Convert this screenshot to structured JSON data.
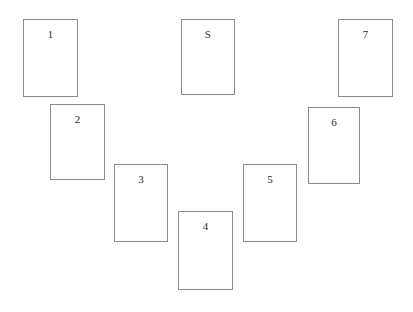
{
  "diagram": {
    "background_color": "#ffffff",
    "border_color": "#8a8a8a",
    "label_color": "#2b2b2b",
    "canvas": {
      "width": 413,
      "height": 312
    },
    "cards": [
      {
        "label": "1",
        "x": 23,
        "y": 19,
        "width": 55,
        "height": 78
      },
      {
        "label": "2",
        "x": 50,
        "y": 104,
        "width": 55,
        "height": 76
      },
      {
        "label": "3",
        "x": 114,
        "y": 164,
        "width": 54,
        "height": 78
      },
      {
        "label": "4",
        "x": 178,
        "y": 211,
        "width": 55,
        "height": 79
      },
      {
        "label": "5",
        "x": 243,
        "y": 164,
        "width": 54,
        "height": 78
      },
      {
        "label": "6",
        "x": 308,
        "y": 107,
        "width": 52,
        "height": 77
      },
      {
        "label": "S",
        "x": 181,
        "y": 19,
        "width": 54,
        "height": 76
      },
      {
        "label": "7",
        "x": 338,
        "y": 19,
        "width": 55,
        "height": 78
      }
    ]
  }
}
